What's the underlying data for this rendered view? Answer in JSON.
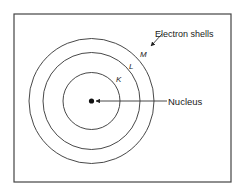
{
  "diagram": {
    "type": "atom-shell-model",
    "frame": {
      "x": 14,
      "y": 14,
      "width": 217,
      "height": 168,
      "stroke": "#444444"
    },
    "nucleus": {
      "label": "Nucleus",
      "cx": 91.5,
      "cy": 101,
      "r": 2.6,
      "color": "#111111"
    },
    "shells": [
      {
        "id": "K",
        "label": "K",
        "r": 28.5,
        "label_x": 116,
        "label_y": 82
      },
      {
        "id": "L",
        "label": "L",
        "r": 48.5,
        "label_x": 129,
        "label_y": 69
      },
      {
        "id": "M",
        "label": "M",
        "r": 62.5,
        "label_x": 140,
        "label_y": 57
      }
    ],
    "annotations": {
      "electron_shells": {
        "text": "Electron shells",
        "x": 155,
        "y": 37
      },
      "nucleus": {
        "text": "Nucleus",
        "x": 168,
        "y": 104.5
      }
    },
    "line_color": "#333333"
  }
}
